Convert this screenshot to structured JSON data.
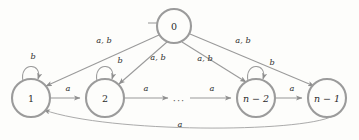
{
  "figure": {
    "kind": "finite-automaton-state-diagram",
    "background_color": "#fdfdfb",
    "stroke_color": "#9a9a9a",
    "text_color": "#2b2b2b",
    "ellipsis": "···",
    "alphabet": [
      "a",
      "b"
    ]
  },
  "states": [
    {
      "id": "q0",
      "label": "0",
      "cx": 174,
      "cy": 26,
      "r": 17,
      "start": true,
      "accepting": false
    },
    {
      "id": "q1",
      "label": "1",
      "cx": 31,
      "cy": 98,
      "r": 19,
      "start": false,
      "accepting": false
    },
    {
      "id": "q2",
      "label": "2",
      "cx": 105,
      "cy": 98,
      "r": 19,
      "start": false,
      "accepting": false
    },
    {
      "id": "qn2",
      "label": "n − 2",
      "cx": 256,
      "cy": 98,
      "r": 19,
      "start": false,
      "accepting": false
    },
    {
      "id": "qn1",
      "label": "n − 1",
      "cx": 327,
      "cy": 98,
      "r": 19,
      "start": false,
      "accepting": false
    }
  ],
  "transitions": [
    {
      "id": "t-start",
      "from": "",
      "to": "q0",
      "label": "",
      "kind": "start-arrow"
    },
    {
      "id": "t-0-1",
      "from": "q0",
      "to": "q1",
      "label": "a, b",
      "label_x": 104,
      "label_y": 40,
      "kind": "straight"
    },
    {
      "id": "t-0-2",
      "from": "q0",
      "to": "q2",
      "label": "a, b",
      "label_x": 158,
      "label_y": 57,
      "kind": "straight"
    },
    {
      "id": "t-0-n2",
      "from": "q0",
      "to": "qn2",
      "label": "a, b",
      "label_x": 205,
      "label_y": 58,
      "kind": "straight"
    },
    {
      "id": "t-0-n1",
      "from": "q0",
      "to": "qn1",
      "label": "a, b",
      "label_x": 243,
      "label_y": 40,
      "kind": "straight"
    },
    {
      "id": "t-1-1",
      "from": "q1",
      "to": "q1",
      "label": "b",
      "label_x": 33,
      "label_y": 56,
      "kind": "self-loop"
    },
    {
      "id": "t-2-2",
      "from": "q2",
      "to": "q2",
      "label": "b",
      "label_x": 120,
      "label_y": 60,
      "kind": "self-loop"
    },
    {
      "id": "t-n2-n2",
      "from": "qn2",
      "to": "qn2",
      "label": "b",
      "label_x": 272,
      "label_y": 62,
      "kind": "self-loop"
    },
    {
      "id": "t-1-2",
      "from": "q1",
      "to": "q2",
      "label": "a",
      "label_x": 68,
      "label_y": 88,
      "kind": "straight"
    },
    {
      "id": "t-2-dots",
      "from": "q2",
      "to": "dots",
      "label": "a",
      "label_x": 146,
      "label_y": 88,
      "kind": "straight"
    },
    {
      "id": "t-dots-n2",
      "from": "dots",
      "to": "qn2",
      "label": "a",
      "label_x": 212,
      "label_y": 88,
      "kind": "straight"
    },
    {
      "id": "t-n2-n1",
      "from": "qn2",
      "to": "qn1",
      "label": "a",
      "label_x": 292,
      "label_y": 88,
      "kind": "straight"
    },
    {
      "id": "t-n1-1",
      "from": "qn1",
      "to": "q1",
      "label": "a",
      "label_x": 180,
      "label_y": 124,
      "kind": "curve-bottom"
    }
  ]
}
